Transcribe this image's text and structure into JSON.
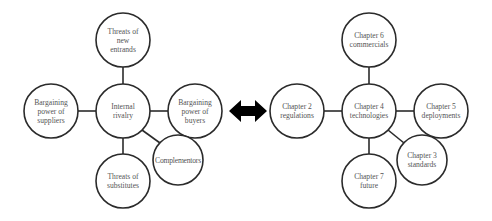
{
  "diagrams": {
    "left": {
      "title": "Porter's five forces with complementors",
      "nodes": [
        {
          "id": "center",
          "label": "Internal\nrivalry",
          "cx": 123,
          "cy": 111,
          "r": 27
        },
        {
          "id": "top",
          "label": "Threats of\nnew\nentrands",
          "cx": 123,
          "cy": 40,
          "r": 27
        },
        {
          "id": "left",
          "label": "Bargaining\npower of\nsuppliers",
          "cx": 51,
          "cy": 111,
          "r": 27
        },
        {
          "id": "right",
          "label": "Bargaining\npower of\nbuyers",
          "cx": 195,
          "cy": 111,
          "r": 27
        },
        {
          "id": "bottom",
          "label": "Threats of\nsubstitutes",
          "cx": 123,
          "cy": 181,
          "r": 27
        },
        {
          "id": "diag",
          "label": "Complementors",
          "cx": 178,
          "cy": 160,
          "r": 25
        }
      ]
    },
    "connector": {
      "icon": "double-headed-arrow-icon",
      "color": "#000000"
    },
    "right": {
      "title": "Book chapter structure",
      "nodes": [
        {
          "id": "center",
          "label": "Chapter 4\ntechnologies",
          "cx": 369,
          "cy": 111,
          "r": 27
        },
        {
          "id": "top",
          "label": "Chapter 6\ncommercials",
          "cx": 369,
          "cy": 40,
          "r": 27
        },
        {
          "id": "left",
          "label": "Chapter 2\nregulations",
          "cx": 297,
          "cy": 111,
          "r": 27
        },
        {
          "id": "right",
          "label": "Chapter 5\ndeployments",
          "cx": 441,
          "cy": 111,
          "r": 27
        },
        {
          "id": "bottom",
          "label": "Chapter 7\nfuture",
          "cx": 369,
          "cy": 181,
          "r": 27
        },
        {
          "id": "diag",
          "label": "Chapter 3\nstandards",
          "cx": 422,
          "cy": 160,
          "r": 25
        }
      ]
    }
  },
  "colors": {
    "stroke": "#2b2b2b",
    "text": "#555555",
    "background": "#ffffff"
  }
}
